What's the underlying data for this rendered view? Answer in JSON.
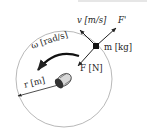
{
  "diagram": {
    "labels": {
      "velocity": "v [m/s]",
      "reaction_force": "F'",
      "mass": "m [kg]",
      "angular_velocity": "ω [rad/s]",
      "force": "F [N]",
      "radius": "r [m]"
    },
    "colors": {
      "stroke": "#222222",
      "circle": "#9a9a9a",
      "background": "#ffffff"
    }
  }
}
